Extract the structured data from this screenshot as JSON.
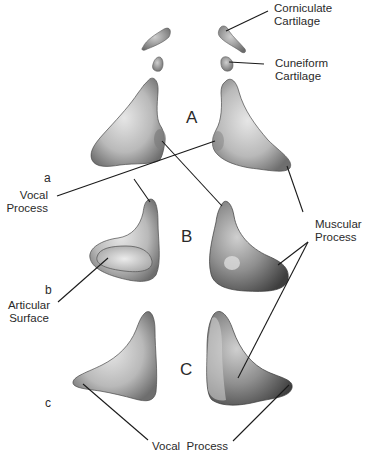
{
  "figure": {
    "views": [
      {
        "letter": "A",
        "sublabel": "a"
      },
      {
        "letter": "B",
        "sublabel": "b"
      },
      {
        "letter": "C",
        "sublabel": "c"
      }
    ],
    "labels": {
      "corniculate": {
        "line1": "Corniculate",
        "line2": "Cartilage"
      },
      "cuneiform": {
        "line1": "Cuneiform",
        "line2": "Cartilage"
      },
      "vocal_process_left": {
        "line1": "Vocal",
        "line2": "Process"
      },
      "muscular_process": {
        "line1": "Muscular",
        "line2": "Process"
      },
      "articular_surface": {
        "line1": "Articular",
        "line2": "Surface"
      },
      "vocal_process_bottom": {
        "text": "Vocal  Process"
      }
    },
    "colors": {
      "background": "#ffffff",
      "cartilage_light": "#d9d9d9",
      "cartilage_mid": "#a8a8a8",
      "cartilage_dark": "#5a5a5a",
      "leader_line": "#1a1a1a",
      "text": "#2a2a2a"
    }
  }
}
